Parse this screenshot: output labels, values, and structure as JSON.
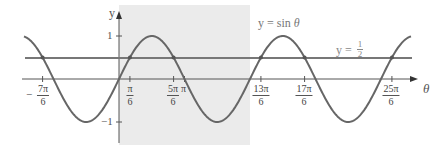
{
  "chart_data": {
    "type": "line",
    "title": "",
    "xlabel": "θ",
    "ylabel": "y",
    "series": [
      {
        "name": "y = sin θ",
        "function": "sin(theta)",
        "x_range": [
          "-3π/2 (approx)",
          "4.5π (approx)"
        ],
        "color": "#6b6b6b"
      },
      {
        "name": "y = 1/2",
        "function": "0.5",
        "color": "#6b6b6b"
      }
    ],
    "x_ticks": [
      "-7π/6",
      "π/6",
      "5π/6",
      "π",
      "13π/6",
      "17π/6",
      "25π/6"
    ],
    "x_tick_values_over_pi": [
      -1.1667,
      0.1667,
      0.8333,
      1.0,
      2.1667,
      2.8333,
      4.1667
    ],
    "y_ticks": [
      "1",
      "-1"
    ],
    "y_tick_values": [
      1,
      -1
    ],
    "ylim": [
      -1.3,
      1.5
    ],
    "shaded_region": {
      "x_from": "0",
      "x_to": "2π",
      "color": "#ebebeb"
    },
    "intersections_over_pi": [
      -1.1667,
      0.1667,
      0.8333,
      2.1667,
      2.8333,
      4.1667
    ],
    "annotations": [
      {
        "text": "y = sin θ",
        "position": "top right"
      },
      {
        "text": "y = 1/2",
        "position": "right, above line"
      }
    ],
    "grid": false,
    "legend": "none"
  },
  "labels": {
    "y_axis": "y",
    "x_axis": "θ",
    "y_one": "1",
    "y_neg_one": "−1",
    "sin_label_prefix": "y = sin ",
    "sin_label_var": "θ",
    "half_label_prefix": "y = ",
    "half_num": "1",
    "half_den": "2",
    "minus": "−"
  },
  "ticks": [
    {
      "num": "7π",
      "den": "6",
      "neg": true
    },
    {
      "num": "π",
      "den": "6"
    },
    {
      "num": "5π",
      "den": "6"
    },
    {
      "single": "π"
    },
    {
      "num": "13π",
      "den": "6"
    },
    {
      "num": "17π",
      "den": "6"
    },
    {
      "num": "25π",
      "den": "6"
    }
  ]
}
